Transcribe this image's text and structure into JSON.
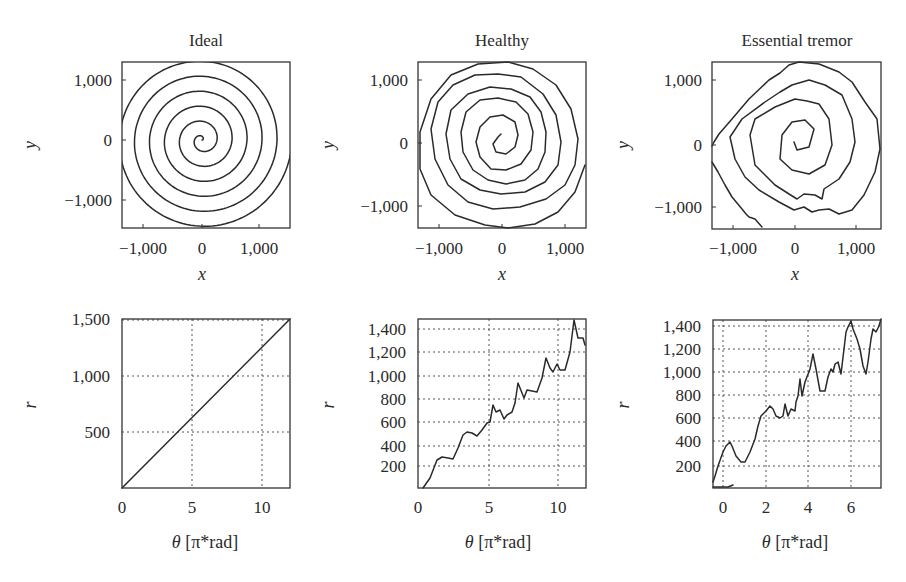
{
  "figure": {
    "panels": [
      {
        "id": "ideal-spiral",
        "title": "Ideal",
        "xlabel": "x",
        "ylabel": "y",
        "xticks": [
          "−1,000",
          "0",
          "1,000"
        ],
        "yticks": [
          "1,000",
          "0",
          "−1,000"
        ]
      },
      {
        "id": "healthy-spiral",
        "title": "Healthy",
        "xlabel": "x",
        "ylabel": "y",
        "xticks": [
          "−1,000",
          "0",
          "1,000"
        ],
        "yticks": [
          "1,000",
          "0",
          "−1,000"
        ]
      },
      {
        "id": "tremor-spiral",
        "title": "Essential tremor",
        "xlabel": "x",
        "ylabel": "y",
        "xticks": [
          "−1,000",
          "0",
          "1,000"
        ],
        "yticks": [
          "1,000",
          "0",
          "−1,000"
        ]
      },
      {
        "id": "ideal-radius",
        "xlabel_symbol": "θ",
        "xlabel_unit": " [π*rad]",
        "ylabel": "r",
        "xticks": [
          "0",
          "5",
          "10"
        ],
        "yticks": [
          "1,500",
          "1,000",
          "500"
        ]
      },
      {
        "id": "healthy-radius",
        "xlabel_symbol": "θ",
        "xlabel_unit": " [π*rad]",
        "ylabel": "r",
        "xticks": [
          "0",
          "5",
          "10"
        ],
        "yticks": [
          "1,400",
          "1,200",
          "1,000",
          "800",
          "600",
          "400",
          "200"
        ]
      },
      {
        "id": "tremor-radius",
        "xlabel_symbol": "θ",
        "xlabel_unit": " [π*rad]",
        "ylabel": "r",
        "xticks": [
          "0",
          "2",
          "4",
          "6"
        ],
        "yticks": [
          "1,400",
          "1,200",
          "1,000",
          "800",
          "600",
          "400",
          "200"
        ]
      }
    ]
  },
  "chart_data": [
    {
      "type": "line",
      "title": "Ideal",
      "subplot": "top-left",
      "xlabel": "x",
      "ylabel": "y",
      "xlim": [
        -1400,
        1500
      ],
      "ylim": [
        -1450,
        1300
      ],
      "grid": false,
      "description": "Archimedean spiral r = 125*theta, theta from 0 to 12*pi (6 turns)",
      "series": [
        {
          "name": "ideal spiral",
          "param": {
            "r_per_pi_rad": 125,
            "theta_max_pi": 12
          }
        }
      ]
    },
    {
      "type": "line",
      "title": "Healthy",
      "subplot": "top-middle",
      "xlabel": "x",
      "ylabel": "y",
      "xlim": [
        -1400,
        1400
      ],
      "ylim": [
        -1450,
        1300
      ],
      "grid": false,
      "description": "Hand-drawn spiral, smooth, slightly irregular, ~6 turns"
    },
    {
      "type": "line",
      "title": "Essential tremor",
      "subplot": "top-right",
      "xlabel": "x",
      "ylabel": "y",
      "xlim": [
        -1400,
        1400
      ],
      "ylim": [
        -1400,
        1300
      ],
      "grid": false,
      "description": "Hand-drawn spiral with jagged tremor oscillations, ~4 turns"
    },
    {
      "type": "line",
      "subplot": "bottom-left",
      "xlabel": "θ [π*rad]",
      "ylabel": "r",
      "xlim": [
        0,
        12
      ],
      "ylim": [
        0,
        1500
      ],
      "grid": true,
      "x": [
        0,
        12
      ],
      "series": [
        {
          "name": "ideal r(θ)",
          "values": [
            0,
            1500
          ]
        }
      ]
    },
    {
      "type": "line",
      "subplot": "bottom-middle",
      "xlabel": "θ [π*rad]",
      "ylabel": "r",
      "xlim": [
        0,
        12
      ],
      "ylim": [
        0,
        1460
      ],
      "grid": true,
      "x": [
        0.4,
        1.3,
        1.7,
        2.5,
        3.1,
        3.6,
        4.2,
        5.0,
        5.3,
        6.0,
        6.8,
        7.2,
        7.7,
        8.4,
        9.1,
        9.7,
        10.0,
        10.5,
        11.1,
        11.4,
        12.0
      ],
      "series": [
        {
          "name": "healthy r(θ)",
          "values": [
            0,
            260,
            270,
            250,
            480,
            470,
            560,
            590,
            720,
            620,
            770,
            950,
            810,
            860,
            1120,
            1030,
            1070,
            1020,
            1460,
            1300,
            1250
          ]
        }
      ]
    },
    {
      "type": "line",
      "subplot": "bottom-right",
      "xlabel": "θ [π*rad]",
      "ylabel": "r",
      "xlim": [
        -0.47,
        7.4
      ],
      "ylim": [
        0,
        1460
      ],
      "grid": true,
      "x": [
        -0.47,
        -0.2,
        0.0,
        0.3,
        0.8,
        1.1,
        1.6,
        2.0,
        2.3,
        2.7,
        3.0,
        3.4,
        3.55,
        3.7,
        4.0,
        4.2,
        4.5,
        5.0,
        5.5,
        5.6,
        5.85,
        6.0,
        6.3,
        6.6,
        6.8,
        7.1,
        7.4
      ],
      "series": [
        {
          "name": "essential tremor r(θ)",
          "values": [
            60,
            270,
            390,
            420,
            260,
            230,
            480,
            640,
            700,
            620,
            740,
            640,
            990,
            780,
            1050,
            1170,
            850,
            1000,
            1110,
            960,
            1380,
            1460,
            1280,
            1000,
            1160,
            1390,
            1460
          ]
        }
      ]
    }
  ]
}
